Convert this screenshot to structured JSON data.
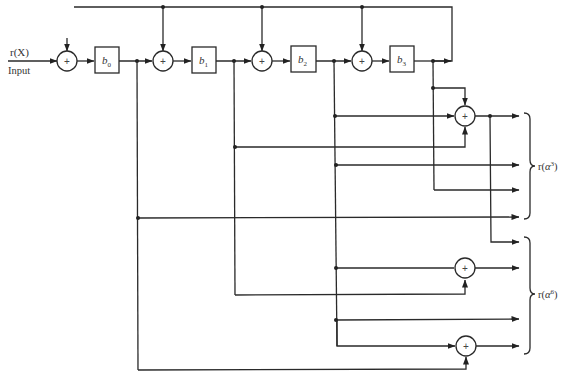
{
  "diagram": {
    "input": {
      "signal_label": "r(X)",
      "caption": "Input"
    },
    "registers": [
      {
        "id": "b0",
        "base": "b",
        "sub": "0"
      },
      {
        "id": "b1",
        "base": "b",
        "sub": "1"
      },
      {
        "id": "b2",
        "base": "b",
        "sub": "2"
      },
      {
        "id": "b3",
        "base": "b",
        "sub": "3"
      }
    ],
    "adder_symbol": "+",
    "outputs": [
      {
        "id": "r-alpha3",
        "prefix": "r(",
        "base": "α",
        "exp": "3",
        "suffix": ")"
      },
      {
        "id": "r-alpha6",
        "prefix": "r(",
        "base": "α",
        "exp": "6",
        "suffix": ")"
      }
    ],
    "colors": {
      "line": "#2a2a2a",
      "background": "#ffffff"
    }
  }
}
